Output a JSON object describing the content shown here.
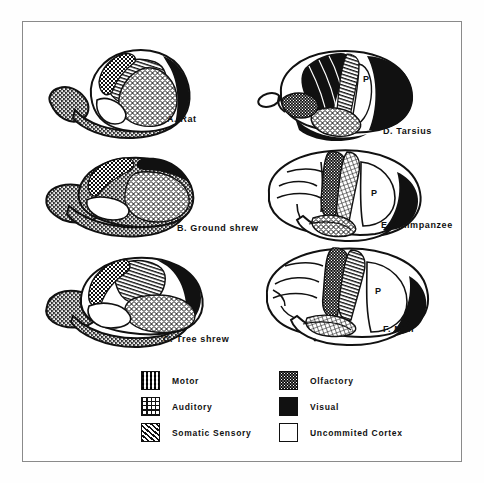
{
  "figure": {
    "border_color": "#8a8a8a",
    "background": "#ffffff"
  },
  "brains": [
    {
      "id": "rat",
      "caption": "A.  Rat",
      "p_label": ""
    },
    {
      "id": "ground-shrew",
      "caption": "B.  Ground shrew",
      "p_label": ""
    },
    {
      "id": "tree-shrew",
      "caption": "C.  Tree shrew",
      "p_label": ""
    },
    {
      "id": "tarsius",
      "caption": "D.  Tarsius",
      "p_label": "P"
    },
    {
      "id": "chimpanzee",
      "caption": "E.  Chimpanzee",
      "p_label": "P"
    },
    {
      "id": "man",
      "caption": "F.  Man",
      "p_label": "P"
    }
  ],
  "legend": {
    "left_column": [
      {
        "label": "Motor",
        "pattern": "checkerboard"
      },
      {
        "label": "Auditory",
        "pattern": "grid"
      },
      {
        "label": "Somatic  Sensory",
        "pattern": "diagonal-hatch"
      }
    ],
    "right_column": [
      {
        "label": "Olfactory",
        "pattern": "fine-stipple"
      },
      {
        "label": "Visual",
        "pattern": "solid-black"
      },
      {
        "label": "Uncommited  Cortex",
        "pattern": "white"
      }
    ]
  },
  "colors": {
    "ink": "#111111",
    "paper": "#ffffff",
    "frame": "#8a8a8a"
  }
}
